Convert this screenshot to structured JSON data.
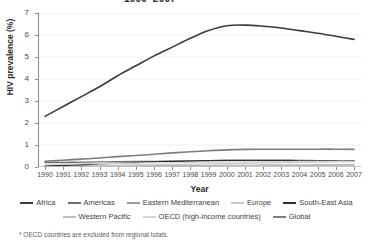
{
  "chart_data": {
    "type": "line",
    "title": "1990–2007",
    "xlabel": "Year",
    "ylabel": "HIV prevalence (%)",
    "xlim": [
      1990,
      2007
    ],
    "ylim": [
      0,
      7
    ],
    "grid": true,
    "legend_position": "bottom",
    "yticks": [
      0,
      1,
      2,
      3,
      4,
      5,
      6,
      7
    ],
    "x": [
      1990,
      1991,
      1992,
      1993,
      1994,
      1995,
      1996,
      1997,
      1998,
      1999,
      2000,
      2001,
      2002,
      2003,
      2004,
      2005,
      2006,
      2007
    ],
    "xticklabels": [
      "1990",
      "1991",
      "1992",
      "1993",
      "1994",
      "1995",
      "1996",
      "1997",
      "1998",
      "1999",
      "2000",
      "2001",
      "2002",
      "2003",
      "2004",
      "2005",
      "2006",
      "2007"
    ],
    "series": [
      {
        "name": "Africa",
        "color": "#3b3b3b",
        "width": 1.6,
        "values": [
          2.3,
          2.75,
          3.2,
          3.65,
          4.15,
          4.6,
          5.05,
          5.45,
          5.85,
          6.2,
          6.42,
          6.45,
          6.4,
          6.32,
          6.2,
          6.08,
          5.94,
          5.8
        ]
      },
      {
        "name": "Americas",
        "color": "#6e6e6e",
        "width": 1.3,
        "values": [
          0.2,
          0.21,
          0.22,
          0.23,
          0.24,
          0.25,
          0.26,
          0.27,
          0.28,
          0.29,
          0.3,
          0.3,
          0.3,
          0.3,
          0.3,
          0.29,
          0.29,
          0.28
        ]
      },
      {
        "name": "Eastern Mediterranean",
        "color": "#9a9a9a",
        "width": 1.3,
        "values": [
          0.02,
          0.02,
          0.03,
          0.03,
          0.04,
          0.04,
          0.05,
          0.05,
          0.06,
          0.06,
          0.07,
          0.07,
          0.08,
          0.08,
          0.08,
          0.09,
          0.09,
          0.09
        ]
      },
      {
        "name": "Europe",
        "color": "#c9c9c9",
        "width": 1.3,
        "values": [
          0.04,
          0.05,
          0.06,
          0.07,
          0.08,
          0.09,
          0.1,
          0.11,
          0.13,
          0.14,
          0.16,
          0.17,
          0.19,
          0.2,
          0.21,
          0.22,
          0.23,
          0.24
        ]
      },
      {
        "name": "South-East Asia",
        "color": "#2e2e2e",
        "width": 1.3,
        "values": [
          0.04,
          0.07,
          0.1,
          0.14,
          0.17,
          0.2,
          0.23,
          0.25,
          0.27,
          0.29,
          0.3,
          0.3,
          0.3,
          0.3,
          0.29,
          0.29,
          0.28,
          0.28
        ]
      },
      {
        "name": "Western Pacific",
        "color": "#bdbdbd",
        "width": 1.3,
        "values": [
          0.01,
          0.01,
          0.02,
          0.02,
          0.03,
          0.03,
          0.04,
          0.04,
          0.05,
          0.05,
          0.06,
          0.06,
          0.07,
          0.07,
          0.07,
          0.08,
          0.08,
          0.08
        ]
      },
      {
        "name": "OECD (high-income countries)",
        "color": "#d5d5d5",
        "width": 1.3,
        "values": [
          0.13,
          0.14,
          0.15,
          0.16,
          0.17,
          0.18,
          0.19,
          0.2,
          0.21,
          0.22,
          0.23,
          0.23,
          0.24,
          0.24,
          0.25,
          0.25,
          0.26,
          0.26
        ]
      },
      {
        "name": "Global",
        "color": "#7d7d7d",
        "width": 1.6,
        "values": [
          0.26,
          0.31,
          0.36,
          0.41,
          0.47,
          0.52,
          0.58,
          0.64,
          0.69,
          0.74,
          0.78,
          0.8,
          0.81,
          0.81,
          0.81,
          0.81,
          0.81,
          0.8
        ]
      }
    ],
    "footnote": "* OECD countries are excluded from regional totals."
  },
  "legend": {
    "row1": [
      {
        "label": "Africa",
        "color": "#3b3b3b"
      },
      {
        "label": "Americas",
        "color": "#6e6e6e"
      },
      {
        "label": "Eastern Mediterranean",
        "color": "#9a9a9a"
      },
      {
        "label": "Europe",
        "color": "#c9c9c9"
      },
      {
        "label": "South-East Asia",
        "color": "#2e2e2e"
      }
    ],
    "row2": [
      {
        "label": "Western Pacific",
        "color": "#bdbdbd"
      },
      {
        "label": "OECD (high-income countries)",
        "color": "#d5d5d5"
      },
      {
        "label": "Global",
        "color": "#7d7d7d"
      }
    ]
  },
  "axis_colors": {
    "axis_line": "#8c8c8c",
    "grid_line": "#e8e8e8",
    "tick_text": "#4a4a4a"
  }
}
